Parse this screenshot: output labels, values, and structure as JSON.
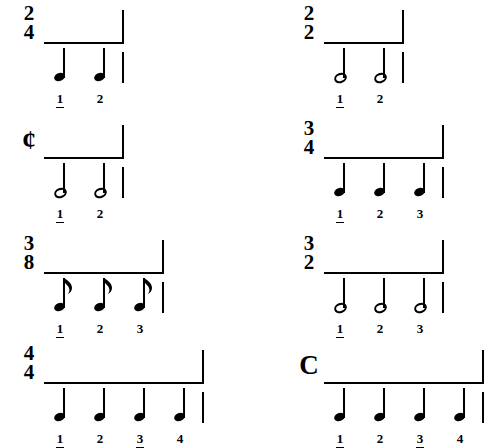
{
  "page": {
    "background_color": "#ffffff",
    "ink_color": "#000000"
  },
  "examples": [
    {
      "id": "two-four",
      "time_signature": {
        "display": "2/4",
        "numerator": "2",
        "denominator": "4",
        "style": "numeric"
      },
      "note_value": "quarter",
      "beats_per_measure": 2,
      "beats": [
        {
          "label": "1",
          "strong": true
        },
        {
          "label": "2",
          "strong": false
        }
      ]
    },
    {
      "id": "two-two",
      "time_signature": {
        "display": "2/2",
        "numerator": "2",
        "denominator": "2",
        "style": "numeric"
      },
      "note_value": "half",
      "beats_per_measure": 2,
      "beats": [
        {
          "label": "1",
          "strong": true
        },
        {
          "label": "2",
          "strong": false
        }
      ]
    },
    {
      "id": "cut-time",
      "time_signature": {
        "display": "cut time",
        "symbol": "¢",
        "style": "symbol"
      },
      "note_value": "half",
      "beats_per_measure": 2,
      "beats": [
        {
          "label": "1",
          "strong": true
        },
        {
          "label": "2",
          "strong": false
        }
      ]
    },
    {
      "id": "three-four",
      "time_signature": {
        "display": "3/4",
        "numerator": "3",
        "denominator": "4",
        "style": "numeric"
      },
      "note_value": "quarter",
      "beats_per_measure": 3,
      "beats": [
        {
          "label": "1",
          "strong": true
        },
        {
          "label": "2",
          "strong": false
        },
        {
          "label": "3",
          "strong": false
        }
      ]
    },
    {
      "id": "three-eight",
      "time_signature": {
        "display": "3/8",
        "numerator": "3",
        "denominator": "8",
        "style": "numeric"
      },
      "note_value": "eighth",
      "beats_per_measure": 3,
      "beats": [
        {
          "label": "1",
          "strong": true
        },
        {
          "label": "2",
          "strong": false
        },
        {
          "label": "3",
          "strong": false
        }
      ]
    },
    {
      "id": "three-two",
      "time_signature": {
        "display": "3/2",
        "numerator": "3",
        "denominator": "2",
        "style": "numeric"
      },
      "note_value": "half",
      "beats_per_measure": 3,
      "beats": [
        {
          "label": "1",
          "strong": true
        },
        {
          "label": "2",
          "strong": false
        },
        {
          "label": "3",
          "strong": false
        }
      ]
    },
    {
      "id": "four-four",
      "time_signature": {
        "display": "4/4",
        "numerator": "4",
        "denominator": "4",
        "style": "numeric"
      },
      "note_value": "quarter",
      "beats_per_measure": 4,
      "beats": [
        {
          "label": "1",
          "strong": true
        },
        {
          "label": "2",
          "strong": false
        },
        {
          "label": "3",
          "strong": true
        },
        {
          "label": "4",
          "strong": false
        }
      ]
    },
    {
      "id": "common-time",
      "time_signature": {
        "display": "common time",
        "symbol": "C",
        "style": "symbol"
      },
      "note_value": "quarter",
      "beats_per_measure": 4,
      "beats": [
        {
          "label": "1",
          "strong": true
        },
        {
          "label": "2",
          "strong": false
        },
        {
          "label": "3",
          "strong": true
        },
        {
          "label": "4",
          "strong": false
        }
      ]
    }
  ]
}
